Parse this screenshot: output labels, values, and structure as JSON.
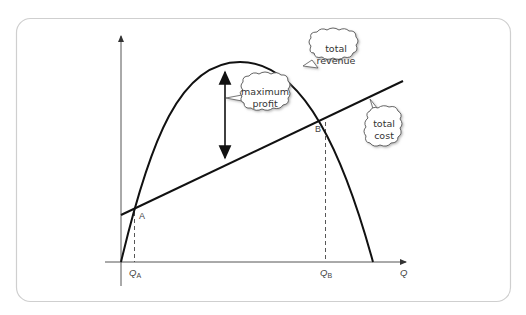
{
  "diagram": {
    "axes": {
      "x_label": "Q",
      "y_label": ""
    },
    "curves": [
      {
        "name": "total revenue",
        "shape": "inverted parabola"
      },
      {
        "name": "total cost",
        "shape": "upward sloping line"
      }
    ],
    "points": [
      {
        "label": "A",
        "q_label_main": "Q",
        "q_label_sub": "A"
      },
      {
        "label": "B",
        "q_label_main": "Q",
        "q_label_sub": "B"
      }
    ],
    "callouts": {
      "total_revenue": [
        "total",
        "revenue"
      ],
      "maximum_profit": [
        "maximum",
        "profit"
      ],
      "total_cost": [
        "total",
        "cost"
      ]
    },
    "colors": {
      "line": "#111111",
      "axis": "#555555",
      "frame": "#cccccc",
      "cloud_fill": "#ffffff",
      "text": "#333333"
    }
  }
}
